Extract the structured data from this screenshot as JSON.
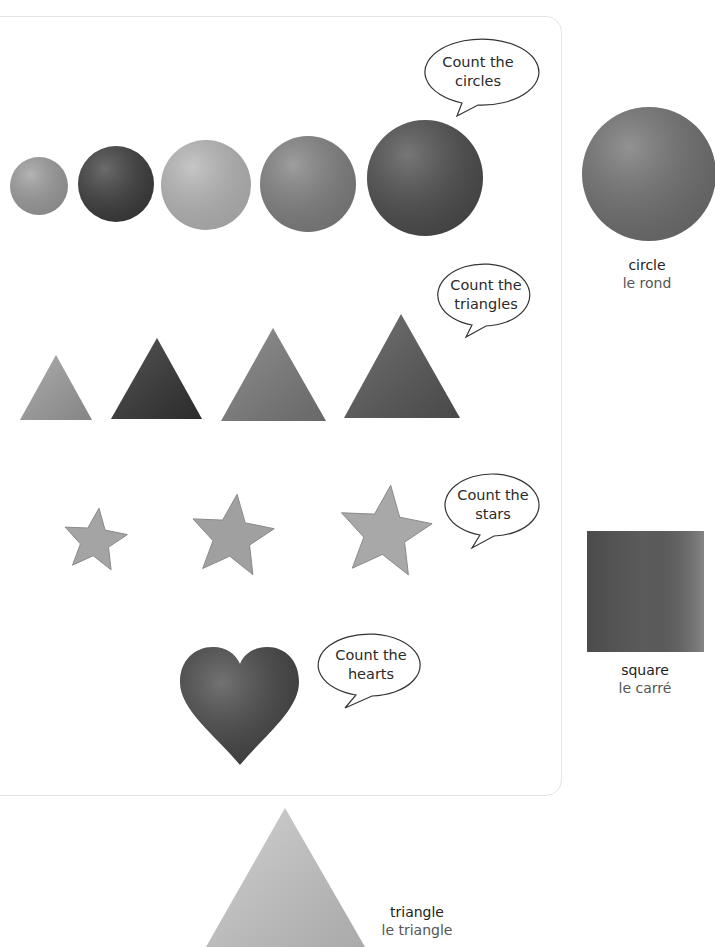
{
  "sections": {
    "circles": {
      "prompt": [
        "Count the",
        "circles"
      ],
      "count": 5,
      "shades": [
        "#9a9a9a",
        "#3a3a3a",
        "#b4b4b4",
        "#7e7e7e",
        "#4a4a4a"
      ]
    },
    "triangles": {
      "prompt": [
        "Count the",
        "triangles"
      ],
      "count": 4,
      "shades": [
        "#9d9d9d",
        "#333333",
        "#7a7a7a",
        "#565656"
      ]
    },
    "stars": {
      "prompt": [
        "Count the",
        "stars"
      ],
      "count": 3,
      "shades": [
        "#a4a4a4",
        "#a0a0a0",
        "#a8a8a8"
      ]
    },
    "hearts": {
      "prompt": [
        "Count the",
        "hearts"
      ],
      "count": 1,
      "shades": [
        "#444444"
      ]
    }
  },
  "vocabulary": {
    "circle": {
      "english": "circle",
      "french": "le rond",
      "shade": "#6e6e6e"
    },
    "square": {
      "english": "square",
      "french": "le carré",
      "shade": "#5c5c5c"
    },
    "triangle": {
      "english": "triangle",
      "french": "le triangle",
      "shade": "#c8c8c8"
    }
  }
}
